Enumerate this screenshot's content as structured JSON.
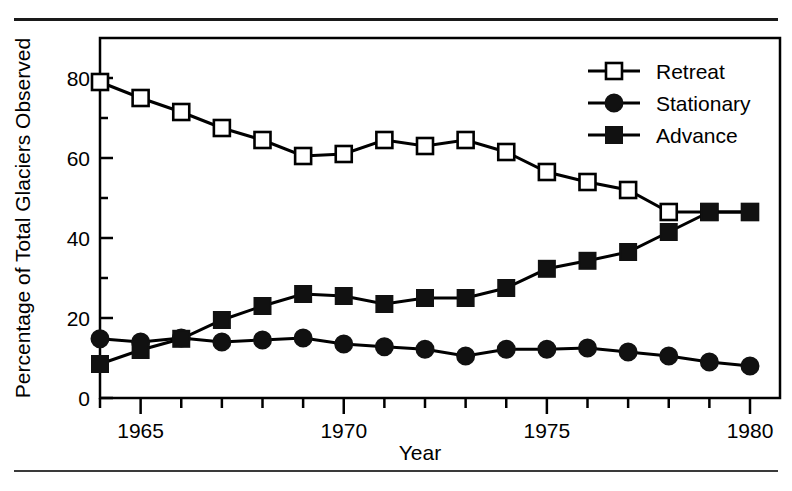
{
  "figure": {
    "top_caption_faint": "",
    "has_top_rule": true,
    "has_bottom_rule": true
  },
  "chart_data": {
    "type": "line",
    "title": "",
    "xlabel": "Year",
    "ylabel": "Percentage of Total Glaciers Observed",
    "xlim": [
      1963.5,
      1980.5
    ],
    "ylim": [
      0,
      88
    ],
    "xticks": [
      1964,
      1965,
      1966,
      1967,
      1968,
      1969,
      1970,
      1971,
      1972,
      1973,
      1974,
      1975,
      1976,
      1977,
      1978,
      1979,
      1980
    ],
    "xticklabels": [
      "",
      "1965",
      "",
      "",
      "",
      "",
      "1970",
      "",
      "",
      "",
      "",
      "1975",
      "",
      "",
      "",
      "",
      "1980"
    ],
    "yticks": [
      0,
      20,
      40,
      60,
      80
    ],
    "yticklabels": [
      "0",
      "20",
      "40",
      "60",
      "80"
    ],
    "yminorticks": [
      10,
      30,
      50,
      70
    ],
    "grid": false,
    "legend_position": "upper right",
    "x": [
      1964,
      1965,
      1966,
      1967,
      1968,
      1969,
      1970,
      1971,
      1972,
      1973,
      1974,
      1975,
      1976,
      1977,
      1978,
      1979,
      1980
    ],
    "series": [
      {
        "name": "Retreat",
        "marker": "open-square",
        "values": [
          79,
          75,
          71.5,
          67.5,
          64.5,
          60.5,
          61,
          64.5,
          63,
          64.5,
          61.5,
          56.5,
          54,
          52,
          46.5,
          46.5,
          46.5
        ]
      },
      {
        "name": "Stationary",
        "marker": "filled-circle",
        "values": [
          14.8,
          14,
          15,
          14,
          14.5,
          15,
          13.5,
          12.8,
          12.2,
          10.5,
          12.2,
          12.2,
          12.5,
          11.5,
          10.5,
          9,
          8
        ]
      },
      {
        "name": "Advance",
        "marker": "filled-square",
        "values": [
          8.5,
          12,
          14.8,
          19.5,
          23,
          26,
          25.5,
          23.5,
          25,
          25,
          27.5,
          32.3,
          34.3,
          36.5,
          41.5,
          46.5,
          46.5
        ]
      }
    ]
  },
  "legend": {
    "entries": [
      {
        "label": "Retreat",
        "marker": "open-square"
      },
      {
        "label": "Stationary",
        "marker": "filled-circle"
      },
      {
        "label": "Advance",
        "marker": "filled-square"
      }
    ]
  },
  "colors": {
    "ink": "#000000",
    "rule": "#1a1a1a",
    "background": "#ffffff"
  }
}
